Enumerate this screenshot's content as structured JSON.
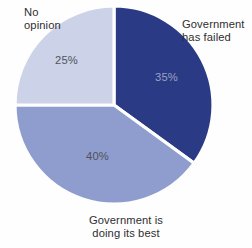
{
  "chart_data": {
    "type": "pie",
    "title": "",
    "subtitle": "",
    "xlabel": "",
    "ylabel": "",
    "legend_position": "callout-labels",
    "grid": false,
    "unit": "%",
    "total": 100,
    "categories": [
      "Government has failed",
      "Government is doing its best",
      "No opinion"
    ],
    "values": [
      35,
      40,
      25
    ],
    "value_labels": [
      "35%",
      "40%",
      "25%"
    ],
    "colors": [
      "#2a3a85",
      "#8e9cce",
      "#ccd2e8"
    ],
    "slices": [
      {
        "label": "Government has failed",
        "label_line_1": "Government",
        "label_line_2": "has failed",
        "value": 35,
        "value_label": "35%",
        "color": "#2a3a85",
        "start_angle_deg": 0,
        "sweep_deg": 126,
        "label_position": "right"
      },
      {
        "label": "Government is doing its best",
        "label_line_1": "Government is",
        "label_line_2": "doing its best",
        "value": 40,
        "value_label": "40%",
        "color": "#8e9cce",
        "start_angle_deg": 126,
        "sweep_deg": 144,
        "label_position": "bottom"
      },
      {
        "label": "No opinion",
        "label_line_1": "No",
        "label_line_2": "opinion",
        "value": 25,
        "value_label": "25%",
        "color": "#ccd2e8",
        "start_angle_deg": 270,
        "sweep_deg": 90,
        "label_position": "top-left"
      }
    ]
  },
  "style": {
    "background": "#fefefe",
    "separator_color": "#fefefe",
    "text_color": "#2e2e30",
    "dark_slice_text_color": "#9aa2c4"
  }
}
